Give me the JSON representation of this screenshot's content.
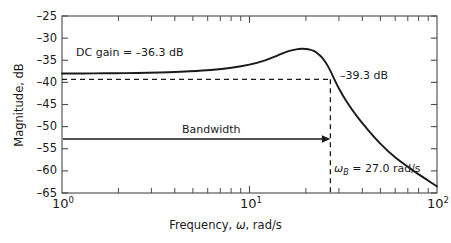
{
  "chart_data": {
    "type": "line",
    "title": "",
    "xlabel": "Frequency, ω, rad/s",
    "ylabel": "Magnitude, dB",
    "xscale": "log",
    "xlim": [
      1,
      100
    ],
    "ylim": [
      -65,
      -25
    ],
    "grid": false,
    "legend": "none",
    "x_tick_labels": [
      "10⁰",
      "10¹",
      "10²"
    ],
    "x_ticks": [
      1,
      10,
      100
    ],
    "y_ticks": [
      -25,
      -30,
      -35,
      -40,
      -45,
      -50,
      -55,
      -60,
      -65
    ],
    "y_tick_labels": [
      "–25",
      "–30",
      "–35",
      "–40",
      "–45",
      "–50",
      "–55",
      "–60",
      "–65"
    ],
    "series": [
      {
        "name": "Magnitude",
        "x": [
          1.0,
          1.3,
          1.7,
          2.2,
          2.9,
          3.7,
          4.8,
          6.2,
          8.0,
          10.0,
          12.0,
          14.0,
          16.0,
          18.0,
          19.0,
          20.0,
          21.0,
          22.0,
          23.0,
          24.0,
          25.0,
          26.0,
          27.0,
          28.0,
          30.0,
          33.0,
          37.0,
          42.0,
          50.0,
          60.0,
          75.0,
          100.0
        ],
        "y": [
          -38.0,
          -37.98,
          -37.95,
          -37.9,
          -37.82,
          -37.7,
          -37.5,
          -37.2,
          -36.7,
          -36.0,
          -35.1,
          -34.0,
          -33.0,
          -32.5,
          -32.4,
          -32.45,
          -32.6,
          -32.9,
          -33.4,
          -34.1,
          -35.0,
          -36.1,
          -37.4,
          -38.8,
          -41.4,
          -44.4,
          -47.4,
          -50.3,
          -53.9,
          -57.0,
          -60.0,
          -63.5
        ]
      }
    ],
    "annotations": [
      {
        "name": "dc-gain",
        "text": "DC gain = –36.3 dB",
        "x": 1.25,
        "y": -35.0
      },
      {
        "name": "cutoff-level",
        "text": "–39.3 dB",
        "x": 32,
        "y": -38.5
      },
      {
        "name": "bandwidth",
        "text": "Bandwidth",
        "x": 5.4,
        "y": -51.1
      },
      {
        "name": "bandwidth-value",
        "text": "ωB = 27.0 rad/s",
        "x": 30,
        "y": -59.3
      }
    ],
    "reference_lines": [
      {
        "name": "cutoff-horizontal",
        "type": "horizontal",
        "value": -39.3,
        "style": "dashed"
      },
      {
        "name": "cutoff-vertical",
        "type": "vertical",
        "value": 27.0,
        "style": "dashed"
      }
    ],
    "bandwidth_arrow": {
      "from_x": 1.0,
      "to_x": 27.0,
      "y": -52.8
    }
  },
  "labels": {
    "y_axis_title": "Magnitude, dB",
    "x_axis_title_pre": "Frequency, ",
    "x_axis_title_var": "ω",
    "x_axis_title_post": ", rad/s",
    "dc_gain": "DC gain = –36.3 dB",
    "cutoff_db": "–39.3 dB",
    "bandwidth": "Bandwidth",
    "wb_var": "ω",
    "wb_sub": "B",
    "wb_value": " = 27.0 rad/s",
    "y_ticks": [
      "–25",
      "–30",
      "–35",
      "–40",
      "–45",
      "–50",
      "–55",
      "–60",
      "–65"
    ],
    "x_tick_base": "10",
    "x_tick_exp": [
      "0",
      "1",
      "2"
    ]
  },
  "colors": {
    "curve": "#1a1a1a",
    "axis": "#4a4a4a",
    "background": "#ffffff",
    "text": "#1a1a1a"
  }
}
